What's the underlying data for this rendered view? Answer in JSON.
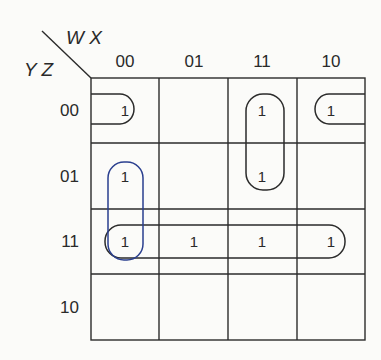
{
  "kmap": {
    "column_variables": "W X",
    "row_variables": "Y Z",
    "column_headers": [
      "00",
      "01",
      "11",
      "10"
    ],
    "row_headers": [
      "00",
      "01",
      "11",
      "10"
    ],
    "cells": [
      [
        "1",
        "",
        "1",
        "1"
      ],
      [
        "1",
        "",
        "1",
        ""
      ],
      [
        "1",
        "1",
        "1",
        "1"
      ],
      [
        "",
        "",
        "",
        ""
      ]
    ],
    "groups": [
      {
        "name": "corners-row-00",
        "cells": [
          [
            0,
            0
          ],
          [
            0,
            3
          ]
        ],
        "color": "#2b2b2b"
      },
      {
        "name": "col-11-rows-00-01",
        "cells": [
          [
            0,
            2
          ],
          [
            1,
            2
          ]
        ],
        "color": "#2b2b2b"
      },
      {
        "name": "col-00-rows-01-11",
        "cells": [
          [
            1,
            0
          ],
          [
            2,
            0
          ]
        ],
        "color": "#2a3f8f"
      },
      {
        "name": "row-11-all",
        "cells": [
          [
            2,
            0
          ],
          [
            2,
            1
          ],
          [
            2,
            2
          ],
          [
            2,
            3
          ]
        ],
        "color": "#2b2b2b"
      }
    ]
  }
}
